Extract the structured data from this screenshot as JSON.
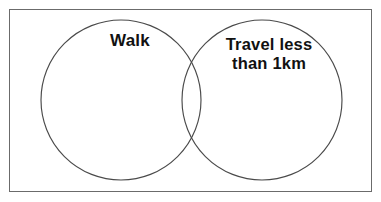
{
  "figure": {
    "type": "venn-diagram",
    "title": "",
    "universe_border_color": "#6b6b6b",
    "circle_stroke_color": "#4a4a4a",
    "background_color": "#ffffff",
    "text_color": "#111111"
  },
  "sets": [
    {
      "id": "walk",
      "label": "Walk",
      "position": "left",
      "center_x": 121,
      "center_y": 100,
      "radius": 80
    },
    {
      "id": "travel-less-than-1km",
      "label": "Travel less\nthan 1km",
      "label_lines": [
        "Travel less",
        "than 1km"
      ],
      "position": "right",
      "center_x": 262,
      "center_y": 100,
      "radius": 80
    }
  ],
  "overlap": {
    "label": "",
    "has_intersection": true
  }
}
